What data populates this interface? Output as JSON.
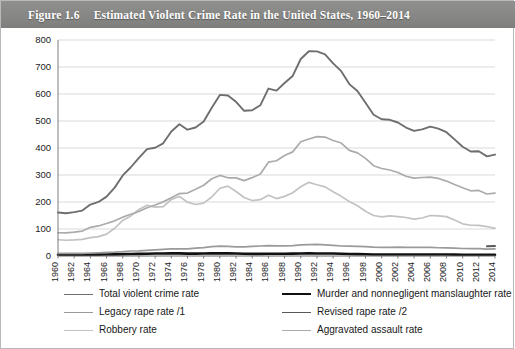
{
  "figure": {
    "number": "Figure 1.6",
    "title": "Estimated Violent Crime Rate in the United States, 1960–2014"
  },
  "legend": {
    "items": [
      {
        "label": "Total violent crime rate",
        "color": "#6e6e6e",
        "width": 1.9,
        "col": "left",
        "row": 0
      },
      {
        "label": "Legacy rape rate /1",
        "color": "#9a9a9a",
        "width": 1.7,
        "col": "left",
        "row": 1
      },
      {
        "label": "Robbery rate",
        "color": "#c2c2c2",
        "width": 1.7,
        "col": "left",
        "row": 2
      },
      {
        "label": "Murder and nonnegligent manslaughter rate",
        "color": "#111111",
        "width": 2.6,
        "col": "right",
        "row": 0
      },
      {
        "label": "Revised rape rate /2",
        "color": "#585858",
        "width": 1.9,
        "col": "right",
        "row": 1
      },
      {
        "label": "Aggravated assault rate",
        "color": "#ababab",
        "width": 1.7,
        "col": "right",
        "row": 2
      }
    ]
  },
  "chart_data": {
    "type": "line",
    "title": "Estimated Violent Crime Rate in the United States, 1960–2014",
    "xlabel": "",
    "ylabel": "",
    "ylim": [
      0,
      800
    ],
    "ytick_step": 100,
    "yticks": [
      "0",
      "100",
      "200",
      "300",
      "400",
      "500",
      "600",
      "700",
      "800"
    ],
    "grid": true,
    "legend_position": "bottom",
    "xlim": [
      1960,
      2014
    ],
    "xtick_step": 2,
    "xtick_rotation": 90,
    "x": [
      1960,
      1961,
      1962,
      1963,
      1964,
      1965,
      1966,
      1967,
      1968,
      1969,
      1970,
      1971,
      1972,
      1973,
      1974,
      1975,
      1976,
      1977,
      1978,
      1979,
      1980,
      1981,
      1982,
      1983,
      1984,
      1985,
      1986,
      1987,
      1988,
      1989,
      1990,
      1991,
      1992,
      1993,
      1994,
      1995,
      1996,
      1997,
      1998,
      1999,
      2000,
      2001,
      2002,
      2003,
      2004,
      2005,
      2006,
      2007,
      2008,
      2009,
      2010,
      2011,
      2012,
      2013,
      2014
    ],
    "xticks": [
      "1960",
      "1962",
      "1964",
      "1966",
      "1968",
      "1970",
      "1972",
      "1974",
      "1976",
      "1978",
      "1980",
      "1982",
      "1984",
      "1986",
      "1988",
      "1990",
      "1992",
      "1994",
      "1996",
      "1998",
      "2000",
      "2002",
      "2004",
      "2006",
      "2008",
      "2010",
      "2012",
      "2014"
    ],
    "series": [
      {
        "name": "Total violent crime rate",
        "color": "#6e6e6e",
        "width": 1.9,
        "values": [
          160.9,
          158.1,
          162.3,
          168.2,
          190.6,
          200.2,
          220.0,
          253.2,
          298.4,
          328.7,
          363.5,
          396.0,
          401.0,
          417.4,
          461.1,
          487.8,
          467.8,
          475.9,
          497.8,
          548.9,
          596.6,
          594.3,
          571.1,
          537.7,
          539.9,
          558.1,
          620.1,
          612.5,
          640.6,
          666.9,
          729.6,
          758.2,
          757.7,
          747.1,
          713.6,
          684.5,
          636.6,
          611.0,
          567.6,
          523.0,
          506.5,
          504.5,
          494.4,
          475.8,
          463.2,
          469.0,
          479.3,
          471.8,
          458.6,
          431.9,
          404.5,
          387.1,
          387.8,
          369.1,
          375.7
        ]
      },
      {
        "name": "Murder and nonnegligent manslaughter rate",
        "color": "#111111",
        "width": 2.6,
        "values": [
          5.1,
          4.8,
          4.6,
          4.6,
          4.9,
          5.1,
          5.6,
          6.2,
          6.9,
          7.3,
          7.9,
          8.6,
          9.0,
          9.4,
          9.8,
          9.6,
          8.7,
          8.8,
          9.0,
          9.8,
          10.2,
          9.8,
          9.1,
          8.3,
          7.9,
          8.0,
          8.6,
          8.3,
          8.5,
          8.7,
          9.4,
          9.8,
          9.3,
          9.5,
          9.0,
          8.2,
          7.4,
          6.8,
          6.3,
          5.7,
          5.5,
          5.6,
          5.6,
          5.7,
          5.5,
          5.6,
          5.8,
          5.7,
          5.4,
          5.0,
          4.8,
          4.7,
          4.7,
          4.5,
          4.5
        ]
      },
      {
        "name": "Legacy rape rate /1",
        "color": "#9a9a9a",
        "width": 1.7,
        "values": [
          9.6,
          9.4,
          9.4,
          9.4,
          11.2,
          12.1,
          13.2,
          14.0,
          15.9,
          18.5,
          18.7,
          20.5,
          22.5,
          24.5,
          26.2,
          26.3,
          26.6,
          29.4,
          31.0,
          34.7,
          36.8,
          36.0,
          34.0,
          33.7,
          35.7,
          37.1,
          38.1,
          37.4,
          37.6,
          38.1,
          41.2,
          42.3,
          42.8,
          41.1,
          39.3,
          37.1,
          36.3,
          35.9,
          34.5,
          32.8,
          32.0,
          31.8,
          33.1,
          32.3,
          32.4,
          31.8,
          31.6,
          30.6,
          29.8,
          29.1,
          27.7,
          27.0,
          27.1,
          25.2,
          26.4
        ]
      },
      {
        "name": "Revised rape rate /2",
        "color": "#585858",
        "width": 1.9,
        "values": [
          null,
          null,
          null,
          null,
          null,
          null,
          null,
          null,
          null,
          null,
          null,
          null,
          null,
          null,
          null,
          null,
          null,
          null,
          null,
          null,
          null,
          null,
          null,
          null,
          null,
          null,
          null,
          null,
          null,
          null,
          null,
          null,
          null,
          null,
          null,
          null,
          null,
          null,
          null,
          null,
          null,
          null,
          null,
          null,
          null,
          null,
          null,
          null,
          null,
          null,
          null,
          null,
          null,
          35.9,
          37.0
        ]
      },
      {
        "name": "Robbery rate",
        "color": "#c2c2c2",
        "width": 1.7,
        "values": [
          60.1,
          58.3,
          59.7,
          61.8,
          68.2,
          71.7,
          80.8,
          102.8,
          131.8,
          148.4,
          172.1,
          188.0,
          180.7,
          183.1,
          209.3,
          220.8,
          199.3,
          190.7,
          195.8,
          218.4,
          251.1,
          258.7,
          238.9,
          216.5,
          205.4,
          208.5,
          225.1,
          212.7,
          220.9,
          234.3,
          256.3,
          272.7,
          263.7,
          256.0,
          237.8,
          220.9,
          201.9,
          186.2,
          165.5,
          150.1,
          145.0,
          148.5,
          146.1,
          142.5,
          136.7,
          140.8,
          150.0,
          148.3,
          145.9,
          133.1,
          119.3,
          113.9,
          113.1,
          109.1,
          102.2
        ]
      },
      {
        "name": "Aggravated assault rate",
        "color": "#ababab",
        "width": 1.7,
        "values": [
          86.1,
          85.7,
          88.6,
          92.4,
          106.2,
          111.3,
          120.3,
          130.2,
          143.8,
          154.5,
          164.8,
          178.8,
          188.8,
          200.5,
          215.8,
          231.1,
          233.2,
          247.0,
          262.1,
          286.0,
          298.5,
          289.7,
          289.2,
          279.2,
          290.2,
          304.0,
          347.4,
          352.9,
          372.2,
          385.6,
          422.9,
          433.4,
          441.9,
          440.5,
          427.6,
          418.3,
          391.0,
          382.1,
          361.4,
          334.3,
          324.0,
          318.6,
          309.5,
          295.4,
          288.6,
          290.8,
          292.0,
          287.2,
          277.5,
          264.7,
          252.8,
          241.5,
          242.8,
          229.6,
          232.5
        ]
      }
    ]
  }
}
